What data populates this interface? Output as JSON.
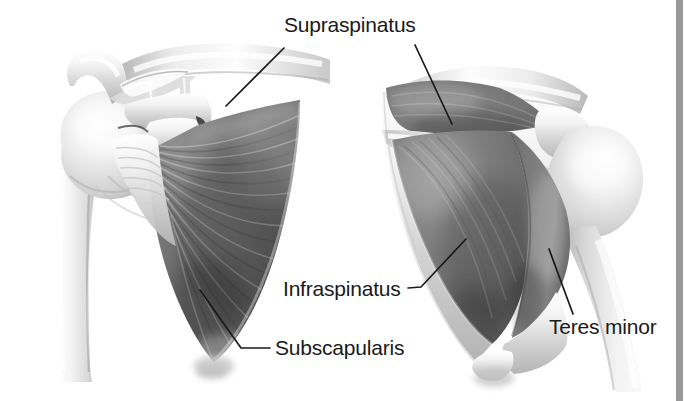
{
  "figure": {
    "background_color": "#ffffff",
    "ink_color": "#1a1a1a",
    "right_rule_color": "#9a9a9a",
    "views": [
      {
        "name": "anterior-view",
        "description": "Anterior view of left scapula and humerus showing subscapularis"
      },
      {
        "name": "posterior-view",
        "description": "Posterior view of left scapula and humerus showing supraspinatus, infraspinatus and teres minor"
      }
    ]
  },
  "labels": {
    "supraspinatus": "Supraspinatus",
    "infraspinatus": "Infraspinatus",
    "subscapularis": "Subscapularis",
    "teres_minor": "Teres minor"
  },
  "leaders": {
    "supraspinatus_left": "M 284 48 L 226 106",
    "supraspinatus_right": "M 415 45 L 452 124",
    "infraspinatus": "M 466 239 L 421 287 L 408 288",
    "subscapularis": "M 200 290 L 241 348 L 270 348",
    "teres_minor": "M 549 249 L 573 314"
  }
}
